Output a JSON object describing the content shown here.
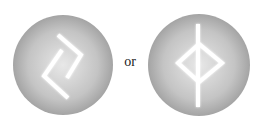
{
  "figure": {
    "left_symbol": {
      "name": "jera-rune",
      "description": "Two interlocking angular hooks in a gray circle"
    },
    "connector_text": "or",
    "right_symbol": {
      "name": "ingwaz-variant-rune",
      "description": "Vertical staff through a diamond in a gray circle"
    }
  },
  "colors": {
    "background": "#ffffff",
    "disc_center": "#e6e6e6",
    "disc_edge": "#a6a6a6",
    "rune_stroke": "#ffffff",
    "text": "#222222"
  }
}
